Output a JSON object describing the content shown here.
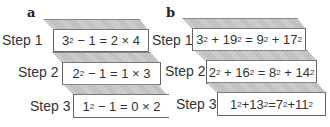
{
  "panels": [
    {
      "label": "a",
      "steps": [
        {
          "label": "Step 1",
          "equation": "3²−1 = 2 × 4",
          "parts": [
            "3",
            "2",
            " − 1 = 2 × 4"
          ]
        },
        {
          "label": "Step 2",
          "equation": "2²−1 = 1 × 3",
          "parts": [
            "2",
            "2",
            " − 1 = 1 × 3"
          ]
        },
        {
          "label": "Step 3",
          "equation": "1²−1 = 0 × 2",
          "parts": [
            "1",
            "2",
            " − 1 = 0 × 2"
          ]
        }
      ]
    },
    {
      "label": "b",
      "steps": [
        {
          "label": "Step 1",
          "equation": "3²+19² = 9²+17²",
          "parts": [
            "3",
            "2",
            " + 19",
            "2",
            " = 9",
            "2",
            " + 17",
            "2"
          ]
        },
        {
          "label": "Step 2",
          "equation": "2²+16² = 8²+14²",
          "parts": [
            "2",
            "2",
            " + 16",
            "2",
            " = 8",
            "2",
            " + 14",
            "2"
          ]
        },
        {
          "label": "Step 3",
          "equation": "1²+13²=7²+11²",
          "parts": [
            "1",
            "2",
            "+13",
            "2",
            "=7",
            "2",
            "+11",
            "2"
          ]
        }
      ]
    }
  ]
}
